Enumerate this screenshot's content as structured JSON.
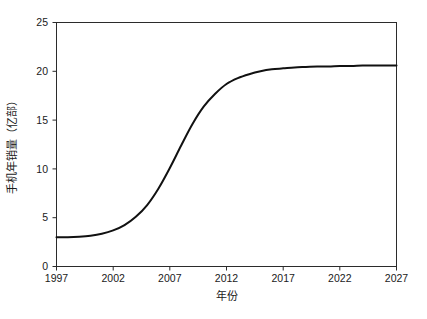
{
  "chart_data": {
    "type": "line",
    "title": "",
    "subtitle": "",
    "xlabel": "年份",
    "ylabel": "手机年销量（亿部）",
    "xlim": [
      1997,
      2027
    ],
    "ylim": [
      0,
      25
    ],
    "xticks": [
      1997,
      2002,
      2007,
      2012,
      2017,
      2022,
      2027
    ],
    "xtick_labels": [
      "1997",
      "2002",
      "2007",
      "2012",
      "2017",
      "2022",
      "2027"
    ],
    "yticks": [
      0,
      5,
      10,
      15,
      20,
      25
    ],
    "ytick_labels": [
      "0",
      "5",
      "10",
      "15",
      "20",
      "25"
    ],
    "grid": false,
    "legend": false,
    "legend_position": "none",
    "line_color": "#111111",
    "frame_color": "#2b2b2b",
    "background_color": "#ffffff",
    "series": [
      {
        "name": "手机年销量",
        "x": [
          1997,
          1998,
          1999,
          2000,
          2001,
          2002,
          2003,
          2004,
          2005,
          2006,
          2007,
          2008,
          2009,
          2010,
          2011,
          2012,
          2013,
          2014,
          2015,
          2016,
          2017,
          2018,
          2019,
          2020,
          2021,
          2022,
          2023,
          2024,
          2025,
          2026,
          2027
        ],
        "values": [
          3.0,
          3.0,
          3.05,
          3.15,
          3.35,
          3.7,
          4.25,
          5.1,
          6.3,
          8.0,
          10.1,
          12.4,
          14.6,
          16.4,
          17.7,
          18.7,
          19.3,
          19.7,
          20.0,
          20.2,
          20.3,
          20.4,
          20.45,
          20.5,
          20.5,
          20.55,
          20.55,
          20.6,
          20.6,
          20.6,
          20.6
        ]
      }
    ],
    "annotations": [],
    "notes": {
      "start_value": 3.0,
      "plateau_value": 20.6,
      "inflection_year": 2009,
      "shape": "logistic S-curve"
    }
  },
  "axes": {
    "x_title": "年份",
    "y_title": "手机年销量（亿部）"
  }
}
